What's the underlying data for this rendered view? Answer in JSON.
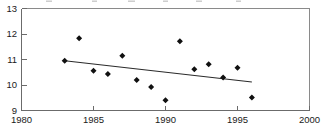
{
  "chart_data": {
    "type": "scatter",
    "title": "",
    "xlabel": "",
    "ylabel": "",
    "xlim": [
      1980,
      2000
    ],
    "ylim": [
      9,
      13
    ],
    "xticks": [
      1980,
      1985,
      1990,
      1995,
      2000
    ],
    "yticks": [
      9,
      10,
      11,
      12,
      13
    ],
    "xtick_labels": [
      "1980",
      "1985",
      "1990",
      "1995",
      "2000"
    ],
    "ytick_labels": [
      "9",
      "10",
      "11",
      "12",
      "13"
    ],
    "grid": false,
    "legend": false,
    "x": [
      1983,
      1984,
      1985,
      1986,
      1987,
      1988,
      1989,
      1990,
      1991,
      1992,
      1993,
      1994,
      1995,
      1996
    ],
    "values": [
      10.95,
      11.83,
      10.56,
      10.43,
      11.15,
      10.2,
      9.92,
      9.4,
      11.72,
      10.62,
      10.81,
      10.29,
      10.68,
      9.51
    ],
    "series": [
      {
        "name": "observations",
        "type": "scatter",
        "marker": "diamond",
        "color": "#111111",
        "x": [
          1983,
          1984,
          1985,
          1986,
          1987,
          1988,
          1989,
          1990,
          1991,
          1992,
          1993,
          1994,
          1995,
          1996
        ],
        "values": [
          10.95,
          11.83,
          10.56,
          10.43,
          11.15,
          10.2,
          9.92,
          9.4,
          11.72,
          10.62,
          10.81,
          10.29,
          10.68,
          9.51
        ]
      },
      {
        "name": "trend-line",
        "type": "line",
        "color": "#2a2a2a",
        "x": [
          1983,
          1996
        ],
        "values": [
          10.95,
          10.12
        ]
      }
    ],
    "annotations": []
  },
  "axes": {
    "y_axis_name": "y-axis",
    "x_axis_name": "x-axis"
  }
}
